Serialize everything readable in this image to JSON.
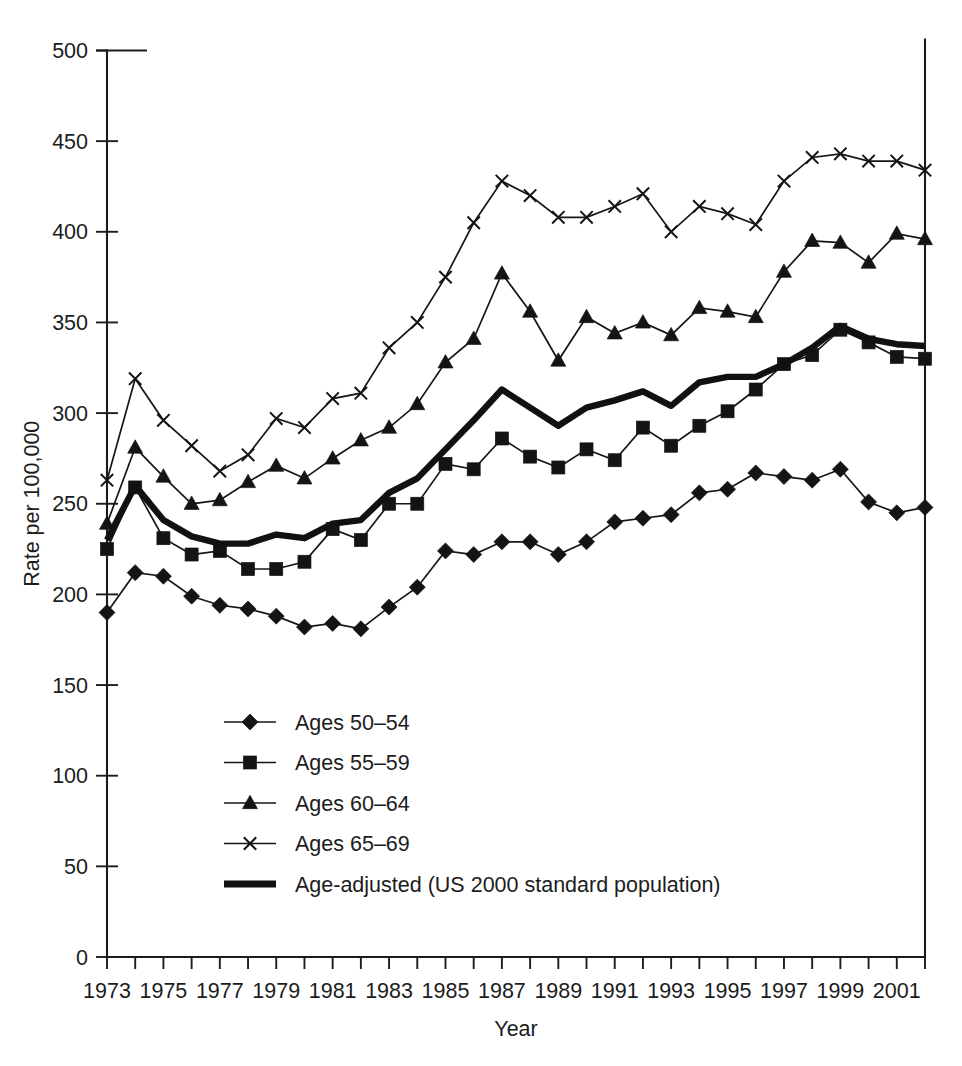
{
  "chart_data": {
    "type": "line",
    "title": "",
    "xlabel": "Year",
    "ylabel": "Rate per 100,000",
    "xlim": [
      1973,
      2002
    ],
    "ylim": [
      0,
      500
    ],
    "ytick_step": 50,
    "grid": false,
    "legend_position": "inside-center-bottom",
    "x": [
      1973,
      1974,
      1975,
      1976,
      1977,
      1978,
      1979,
      1980,
      1981,
      1982,
      1983,
      1984,
      1985,
      1986,
      1987,
      1988,
      1989,
      1990,
      1991,
      1992,
      1993,
      1994,
      1995,
      1996,
      1997,
      1998,
      1999,
      2000,
      2001,
      2002
    ],
    "xtick_labels": [
      "1973",
      "",
      "1975",
      "",
      "1977",
      "",
      "1979",
      "",
      "1981",
      "",
      "1983",
      "",
      "1985",
      "",
      "1987",
      "",
      "1989",
      "",
      "1991",
      "",
      "1993",
      "",
      "1995",
      "",
      "1997",
      "",
      "1999",
      "",
      "2001",
      ""
    ],
    "ytick_labels": [
      "0",
      "50",
      "100",
      "150",
      "200",
      "250",
      "300",
      "350",
      "400",
      "450",
      "500"
    ],
    "series": [
      {
        "name": "Ages 50–54",
        "marker": "diamond",
        "values": [
          190,
          212,
          210,
          199,
          194,
          192,
          188,
          182,
          184,
          181,
          193,
          204,
          224,
          222,
          229,
          229,
          222,
          229,
          240,
          242,
          244,
          256,
          258,
          267,
          265,
          263,
          269,
          251,
          245,
          248
        ]
      },
      {
        "name": "Ages 55–59",
        "marker": "square",
        "values": [
          225,
          259,
          231,
          222,
          224,
          214,
          214,
          218,
          236,
          230,
          250,
          250,
          272,
          269,
          286,
          276,
          270,
          280,
          274,
          292,
          282,
          293,
          301,
          313,
          327,
          332,
          346,
          339,
          331,
          330
        ]
      },
      {
        "name": "Ages 60–64",
        "marker": "triangle",
        "values": [
          239,
          281,
          265,
          250,
          252,
          262,
          271,
          264,
          275,
          285,
          292,
          305,
          328,
          341,
          377,
          356,
          329,
          353,
          344,
          350,
          343,
          358,
          356,
          353,
          378,
          395,
          394,
          383,
          399,
          396
        ]
      },
      {
        "name": "Ages 65–69",
        "marker": "x",
        "values": [
          263,
          319,
          296,
          282,
          268,
          277,
          297,
          292,
          308,
          311,
          336,
          350,
          375,
          405,
          428,
          420,
          408,
          408,
          414,
          421,
          400,
          414,
          410,
          404,
          428,
          441,
          443,
          439,
          439,
          434
        ]
      },
      {
        "name": "Age-adjusted (US 2000 standard population)",
        "marker": "none",
        "style": "thick",
        "values": [
          230,
          260,
          241,
          232,
          228,
          228,
          233,
          231,
          239,
          241,
          256,
          264,
          280,
          296,
          313,
          303,
          293,
          303,
          307,
          312,
          304,
          317,
          320,
          320,
          327,
          336,
          348,
          341,
          338,
          337
        ]
      }
    ],
    "legend": [
      {
        "label": "Ages 50–54",
        "marker": "diamond"
      },
      {
        "label": "Ages 55–59",
        "marker": "square"
      },
      {
        "label": "Ages 60–64",
        "marker": "triangle"
      },
      {
        "label": "Ages 65–69",
        "marker": "x"
      },
      {
        "label": "Age-adjusted (US 2000 standard population)",
        "marker": "thick-line"
      }
    ],
    "colors": {
      "line": "#161616",
      "axis": "#1c1c1c",
      "background": "#ffffff"
    }
  }
}
